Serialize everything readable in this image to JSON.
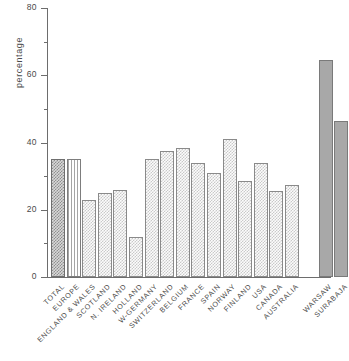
{
  "chart_data": {
    "type": "bar",
    "title": "",
    "xlabel": "",
    "ylabel": "percentage",
    "ylim": [
      0,
      80
    ],
    "yticks": [
      0,
      20,
      40,
      60,
      80
    ],
    "ytick_labels": [
      "0",
      "20",
      "40",
      "60",
      "80"
    ],
    "minor_yticks": [
      10,
      30,
      50,
      70
    ],
    "grid": false,
    "legend": null,
    "categories": [
      "TOTAL",
      "EUROPE",
      "ENGLAND & WALES",
      "SCOTLAND",
      "N. IRELAND",
      "HOLLAND",
      "W-GERMANY",
      "SWITZERLAND",
      "BELGIUM",
      "FRANCE",
      "SPAIN",
      "NORWAY",
      "FINLAND",
      "USA",
      "CANADA",
      "AUSTRALIA",
      "WARSAW",
      "SURABAJA"
    ],
    "values": [
      35,
      35,
      23,
      25,
      26,
      12,
      35,
      37.5,
      38.5,
      34,
      31,
      41,
      28.5,
      34,
      25.5,
      27.5,
      64.5,
      46.5
    ],
    "bar_styles": [
      "dense-checker",
      "vertical-lines",
      "light-checker",
      "light-checker",
      "light-checker",
      "light-checker",
      "light-checker",
      "light-checker",
      "light-checker",
      "light-checker",
      "light-checker",
      "light-checker",
      "light-checker",
      "light-checker",
      "light-checker",
      "light-checker",
      "solid-grey",
      "solid-grey"
    ],
    "group_break_after_index": 15
  },
  "colors": {
    "axis": "#6d6d6d",
    "text": "#4a4a4a",
    "bar_light": "#c9c9c9",
    "bar_dense": "#8f8f8f",
    "bar_solid": "#a8a8a8",
    "background": "#ffffff"
  }
}
